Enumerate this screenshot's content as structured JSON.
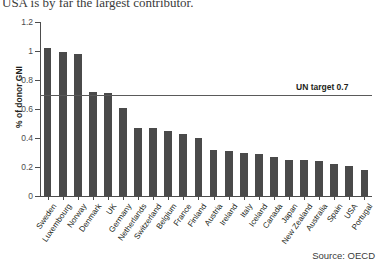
{
  "headline": "USA is by far the largest contributor.",
  "source": "Source: OECD",
  "chart_data": {
    "type": "bar",
    "title": "USA is by far the largest contributor.",
    "xlabel": "",
    "ylabel": "% of donor GNI",
    "ylim": [
      0,
      1.2
    ],
    "ytick_labels": [
      "0",
      "0.2",
      "0.4",
      "0.6",
      "0.8",
      "1",
      "1.2"
    ],
    "yticks": [
      0,
      0.2,
      0.4,
      0.6,
      0.8,
      1,
      1.2
    ],
    "grid": false,
    "legend": "none",
    "bar_color": "#4a4a4a",
    "categories": [
      "Sweden",
      "Luxembourg",
      "Norway",
      "Denmark",
      "UK",
      "Germany",
      "Netherlands",
      "Switzerland",
      "Belgium",
      "France",
      "Finland",
      "Austria",
      "Ireland",
      "Italy",
      "Iceland",
      "Canada",
      "Japan",
      "New Zealand",
      "Australia",
      "Spain",
      "USA",
      "Portugal"
    ],
    "values": [
      1.02,
      0.99,
      0.98,
      0.72,
      0.71,
      0.61,
      0.47,
      0.47,
      0.45,
      0.43,
      0.4,
      0.32,
      0.31,
      0.3,
      0.29,
      0.27,
      0.25,
      0.25,
      0.24,
      0.22,
      0.21,
      0.18
    ],
    "annotations": [
      {
        "name": "un-target",
        "label": "UN target 0.7",
        "value": 0.7,
        "type": "hline",
        "color": "#5a5a5a"
      }
    ]
  }
}
